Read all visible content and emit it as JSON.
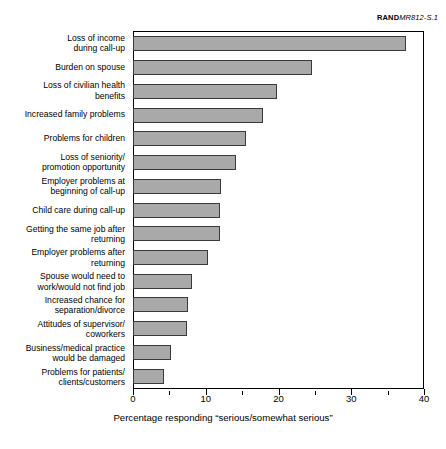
{
  "credit": {
    "publisher": "RAND",
    "document_id": "MR812-S.1"
  },
  "chart_data": {
    "type": "bar",
    "orientation": "horizontal",
    "title": "",
    "xlabel": "Percentage responding “serious/somewhat serious”",
    "ylabel": "",
    "xlim": [
      0,
      40
    ],
    "xticks": [
      0,
      10,
      20,
      30,
      40
    ],
    "xtick_labels": [
      "0",
      "10",
      "20",
      "30",
      "40"
    ],
    "minor_tick_interval": 5,
    "grid": false,
    "legend": "none",
    "bar_color": "#a9a9a9",
    "bar_edge_color": "#3a3a3a",
    "categories": [
      "Loss of income\nduring call-up",
      "Burden on spouse",
      "Loss of civilian health\nbenefits",
      "Increased family problems",
      "Problems for children",
      "Loss of seniority/\npromotion opportunity",
      "Employer problems at\nbeginning of call-up",
      "Child care during call-up",
      "Getting the same job after\nreturning",
      "Employer problems after\nreturning",
      "Spouse would need to\nwork/would not find job",
      "Increased chance for\nseparation/divorce",
      "Attitudes of supervisor/\ncoworkers",
      "Business/medical practice\nwould be damaged",
      "Problems for patients/\nclients/customers"
    ],
    "values": [
      37.4,
      24.5,
      19.7,
      17.7,
      15.4,
      14.0,
      11.9,
      11.8,
      11.8,
      10.2,
      8.0,
      7.4,
      7.3,
      5.1,
      4.1
    ]
  }
}
